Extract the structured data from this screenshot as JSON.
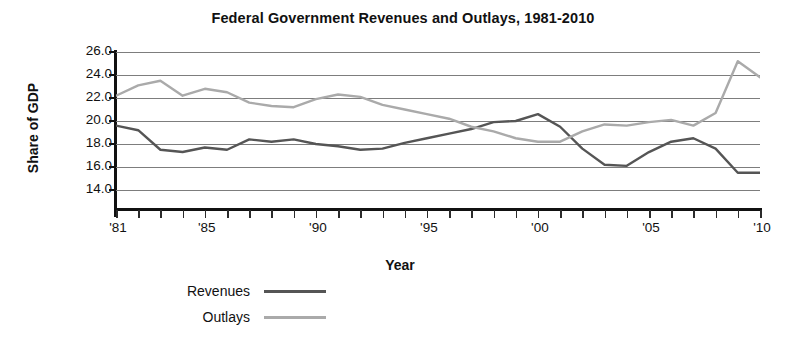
{
  "chart_data": {
    "type": "line",
    "title": "Federal Government Revenues and Outlays, 1981-2010",
    "xlabel": "Year",
    "ylabel": "Share of GDP",
    "grid": true,
    "legend_position": "bottom-left",
    "xlim": [
      1981,
      2010
    ],
    "ylim": [
      14.0,
      26.0
    ],
    "ytick_labels": [
      "26.0",
      "24.0",
      "22.0",
      "20.0",
      "18.0",
      "16.0",
      "14.0"
    ],
    "ytick_values": [
      26.0,
      24.0,
      22.0,
      20.0,
      18.0,
      16.0,
      14.0
    ],
    "x": [
      1981,
      1982,
      1983,
      1984,
      1985,
      1986,
      1987,
      1988,
      1989,
      1990,
      1991,
      1992,
      1993,
      1994,
      1995,
      1996,
      1997,
      1998,
      1999,
      2000,
      2001,
      2002,
      2003,
      2004,
      2005,
      2006,
      2007,
      2008,
      2009,
      2010
    ],
    "xtick_labels": [
      "'81",
      "'85",
      "'90",
      "'95",
      "'00",
      "'05",
      "'10"
    ],
    "xtick_label_values": [
      1981,
      1985,
      1990,
      1995,
      2000,
      2005,
      2010
    ],
    "series": [
      {
        "name": "Revenues",
        "color": "#555555",
        "values": [
          19.6,
          19.2,
          17.5,
          17.3,
          17.7,
          17.5,
          18.4,
          18.2,
          18.4,
          18.0,
          17.8,
          17.5,
          17.6,
          18.1,
          18.5,
          18.9,
          19.3,
          19.9,
          20.0,
          20.6,
          19.5,
          17.6,
          16.2,
          16.1,
          17.3,
          18.2,
          18.5,
          17.6,
          15.5,
          15.5
        ]
      },
      {
        "name": "Outlays",
        "color": "#aaaaaa",
        "values": [
          22.2,
          23.1,
          23.5,
          22.2,
          22.8,
          22.5,
          21.6,
          21.3,
          21.2,
          21.9,
          22.3,
          22.1,
          21.4,
          21.0,
          20.6,
          20.2,
          19.5,
          19.1,
          18.5,
          18.2,
          18.2,
          19.1,
          19.7,
          19.6,
          19.9,
          20.1,
          19.6,
          20.7,
          25.2,
          23.8
        ]
      }
    ]
  },
  "legend": {
    "items": [
      {
        "label": "Revenues",
        "color": "#555555",
        "thickness": "3px"
      },
      {
        "label": "Outlays",
        "color": "#aaaaaa",
        "thickness": "3px"
      }
    ]
  },
  "style": {
    "gridline_color": "#7d7d7d",
    "axis_color": "#111111",
    "background": "#ffffff"
  }
}
